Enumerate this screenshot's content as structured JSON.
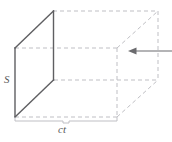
{
  "figure": {
    "kind": "geometry-diagram",
    "background_color": "#ffffff",
    "labels": {
      "area_label": "S",
      "length_label": "ct"
    },
    "colors": {
      "solid_edge": "#5f5f62",
      "hidden_edge": "#bfbfc4",
      "brace": "#bfbfc4",
      "arrow": "#6b6b6e",
      "text": "#5a5a5a"
    },
    "geometry": {
      "front_face": {
        "name": "cross-section-face-S",
        "style": "solid",
        "points": "15,48 53,11 54,80 15,117"
      },
      "back_face": {
        "name": "back-face",
        "style": "dashed",
        "points": "117,48 158,11 158,80 117,117"
      },
      "connectors": [
        {
          "name": "top-front-edge",
          "from": "15,48",
          "to": "117,48",
          "style": "dashed"
        },
        {
          "name": "top-back-edge",
          "from": "53,11",
          "to": "158,11",
          "style": "dashed"
        },
        {
          "name": "bottom-front-edge",
          "from": "15,117",
          "to": "117,117",
          "style": "dashed"
        },
        {
          "name": "bottom-back-edge",
          "from": "54,80",
          "to": "158,80",
          "style": "dashed"
        }
      ]
    },
    "arrow": {
      "name": "incoming-flux-arrow",
      "direction": "left",
      "tail_x": 172,
      "tip_x": 128,
      "y": 51
    },
    "brace": {
      "name": "length-dimension-brace",
      "left_x": 15,
      "right_x": 117,
      "y": 120
    }
  }
}
